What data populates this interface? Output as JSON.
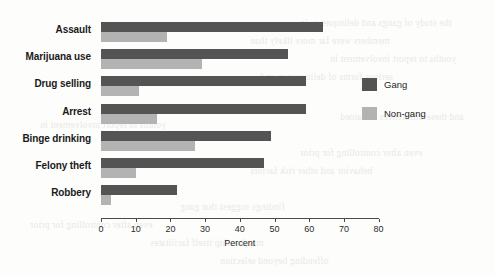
{
  "chart_data": {
    "type": "bar",
    "orientation": "horizontal",
    "title": "",
    "xlabel": "Percent",
    "ylabel": "",
    "xlim": [
      0,
      80
    ],
    "xticks": [
      0,
      10,
      20,
      30,
      40,
      50,
      60,
      70,
      80
    ],
    "grid": false,
    "legend_position": "right",
    "categories": [
      "Assault",
      "Marijuana use",
      "Drug selling",
      "Arrest",
      "Binge drinking",
      "Felony theft",
      "Robbery"
    ],
    "series": [
      {
        "name": "Gang",
        "color": "#545454",
        "values": [
          64,
          54,
          59,
          59,
          49,
          47,
          22
        ]
      },
      {
        "name": "Non-gang",
        "color": "#b3b3b3",
        "values": [
          19,
          29,
          11,
          16,
          27,
          10,
          3
        ]
      }
    ]
  },
  "legend": {
    "items": [
      {
        "label": "Gang"
      },
      {
        "label": "Non-gang"
      }
    ]
  },
  "bleed_text": [
    "the study of gangs and delinquency in",
    "members were far more likely than",
    "youths to report involvement in",
    "serious forms of delinquency and",
    "and these differences remained",
    "even after controlling for prior",
    "behavior and other risk factors",
    "findings suggest that gang",
    "membership itself facilitates",
    "offending beyond selection"
  ]
}
